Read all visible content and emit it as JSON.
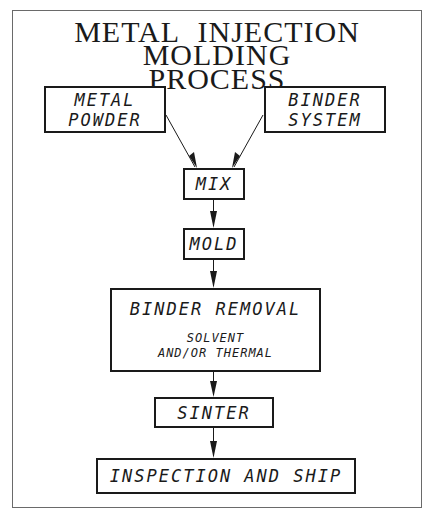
{
  "diagram": {
    "title_line1": "METAL INJECTION MOLDING",
    "title_line2": "PROCESS",
    "nodes": {
      "metal_powder": {
        "line1": "METAL",
        "line2": "POWDER"
      },
      "binder_system": {
        "line1": "BINDER",
        "line2": "SYSTEM"
      },
      "mix": {
        "label": "MIX"
      },
      "mold": {
        "label": "MOLD"
      },
      "binder_removal": {
        "label": "BINDER REMOVAL",
        "sub1": "SOLVENT",
        "sub2": "AND/OR THERMAL"
      },
      "sinter": {
        "label": "SINTER"
      },
      "inspection": {
        "label": "INSPECTION AND SHIP"
      }
    },
    "edges": [
      {
        "from": "METAL POWDER",
        "to": "MIX"
      },
      {
        "from": "BINDER SYSTEM",
        "to": "MIX"
      },
      {
        "from": "MIX",
        "to": "MOLD"
      },
      {
        "from": "MOLD",
        "to": "BINDER REMOVAL"
      },
      {
        "from": "BINDER REMOVAL",
        "to": "SINTER"
      },
      {
        "from": "SINTER",
        "to": "INSPECTION AND SHIP"
      }
    ]
  }
}
